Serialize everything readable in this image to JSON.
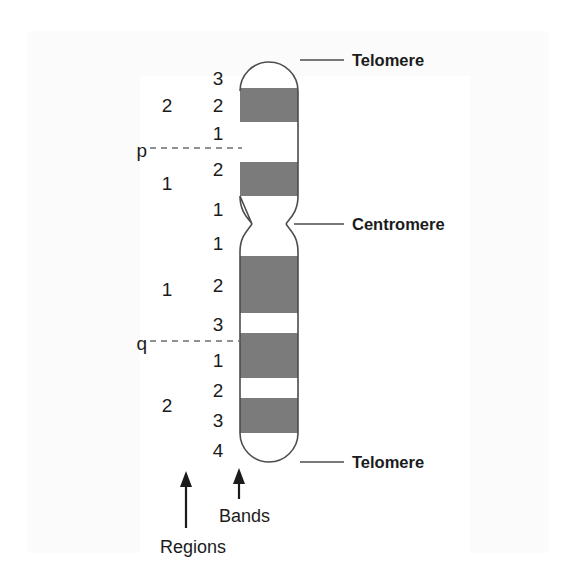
{
  "figure": {
    "colors": {
      "band_dark": "#7b7b7b",
      "band_light": "#ffffff",
      "outline": "#4d4d4d",
      "text": "#1b1b1b",
      "leader_line": "#4d4d4d",
      "dashed_line": "#6e6e6e",
      "background": "#ffffff"
    },
    "chromosome": {
      "left_x": 240,
      "right_x": 298,
      "top_y": 62,
      "bottom_y": 462,
      "centromere_y": 224,
      "p_arm_top": 62,
      "q_arm_bottom": 462,
      "bands": [
        {
          "index": 0,
          "shade": "light",
          "top": 62,
          "bottom": 88,
          "arm": "p",
          "cap": "top"
        },
        {
          "index": 1,
          "shade": "dark",
          "top": 88,
          "bottom": 122,
          "arm": "p"
        },
        {
          "index": 2,
          "shade": "light",
          "top": 122,
          "bottom": 162,
          "arm": "p"
        },
        {
          "index": 3,
          "shade": "dark",
          "top": 162,
          "bottom": 196,
          "arm": "p"
        },
        {
          "index": 4,
          "shade": "light",
          "top": 196,
          "bottom": 224,
          "arm": "p"
        },
        {
          "index": 5,
          "shade": "light",
          "top": 224,
          "bottom": 256,
          "arm": "q"
        },
        {
          "index": 6,
          "shade": "dark",
          "top": 256,
          "bottom": 313,
          "arm": "q"
        },
        {
          "index": 7,
          "shade": "light",
          "top": 313,
          "bottom": 333,
          "arm": "q"
        },
        {
          "index": 8,
          "shade": "dark",
          "top": 333,
          "bottom": 378,
          "arm": "q"
        },
        {
          "index": 9,
          "shade": "light",
          "top": 378,
          "bottom": 398,
          "arm": "q"
        },
        {
          "index": 10,
          "shade": "dark",
          "top": 398,
          "bottom": 433,
          "arm": "q"
        },
        {
          "index": 11,
          "shade": "light",
          "top": 433,
          "bottom": 462,
          "arm": "q",
          "cap": "bottom"
        }
      ]
    },
    "band_labels": [
      {
        "text": "3",
        "y": 78
      },
      {
        "text": "2",
        "y": 105
      },
      {
        "text": "1",
        "y": 133
      },
      {
        "text": "2",
        "y": 169
      },
      {
        "text": "1",
        "y": 209
      },
      {
        "text": "1",
        "y": 243
      },
      {
        "text": "2",
        "y": 285
      },
      {
        "text": "3",
        "y": 324
      },
      {
        "text": "1",
        "y": 360
      },
      {
        "text": "2",
        "y": 390
      },
      {
        "text": "3",
        "y": 420
      },
      {
        "text": "4",
        "y": 450
      }
    ],
    "region_labels": [
      {
        "text": "2",
        "y": 105
      },
      {
        "text": "1",
        "y": 183
      },
      {
        "text": "1",
        "y": 289
      },
      {
        "text": "2",
        "y": 405
      }
    ],
    "arm_labels": [
      {
        "text": "p",
        "y": 150,
        "dash_y": 148
      },
      {
        "text": "q",
        "y": 343,
        "dash_y": 341
      }
    ],
    "callouts": [
      {
        "text": "Telomere",
        "y": 62,
        "text_x": 352,
        "line_x1": 300,
        "line_x2": 344,
        "line_y": 60
      },
      {
        "text": "Centromere",
        "y": 224,
        "text_x": 352,
        "line_x1": 300,
        "line_x2": 344,
        "line_y": 224
      },
      {
        "text": "Telomere",
        "y": 460,
        "text_x": 352,
        "line_x1": 300,
        "line_x2": 344,
        "line_y": 462
      }
    ],
    "axis_labels": [
      {
        "text": "Regions",
        "x": 160,
        "y": 551,
        "arrow_x": 186,
        "arrow_top": 477,
        "arrow_bottom": 528
      },
      {
        "text": "Bands",
        "x": 219,
        "y": 519,
        "arrow_x": 239,
        "arrow_top": 471,
        "arrow_bottom": 499
      }
    ]
  }
}
